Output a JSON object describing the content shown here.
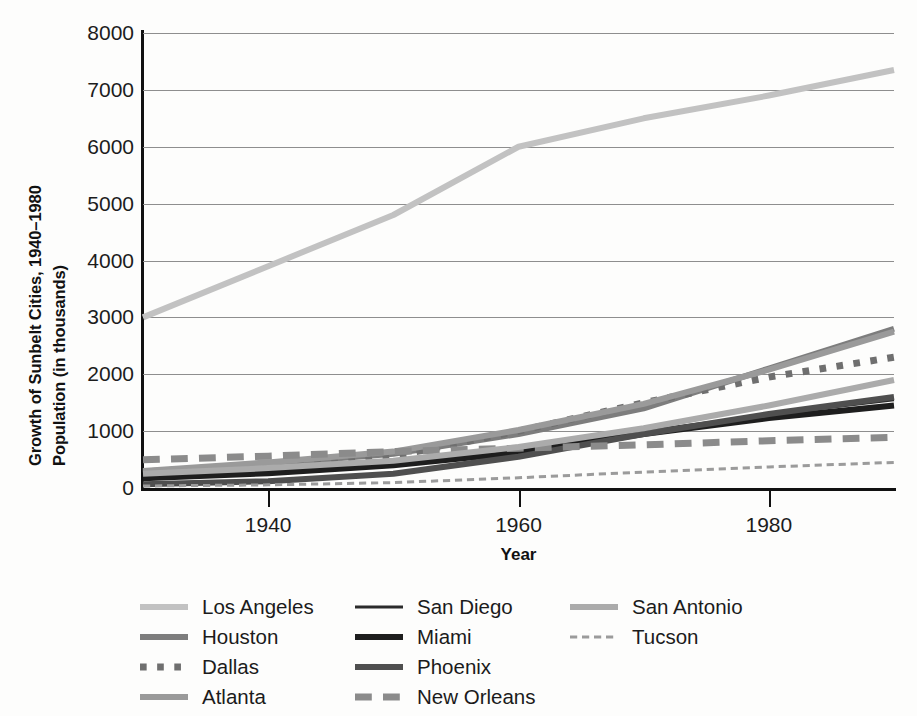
{
  "chart_data": {
    "type": "line",
    "title": "",
    "ylabel_line1": "Growth of Sunbelt Cities, 1940–1980",
    "ylabel_line2": "Population (in thousands)",
    "xlabel": "Year",
    "xlim": [
      1930,
      1990
    ],
    "ylim": [
      0,
      8000
    ],
    "yticks": [
      0,
      1000,
      2000,
      3000,
      4000,
      5000,
      6000,
      7000,
      8000
    ],
    "ytick_labels": [
      "0",
      "1000",
      "2000",
      "3000",
      "4000",
      "5000",
      "6000",
      "7000",
      "8000"
    ],
    "xticks": [
      1940,
      1960,
      1980
    ],
    "xtick_labels": [
      "1940",
      "1960",
      "1980"
    ],
    "grid": "horizontal",
    "legend_position": "below-plot-three-columns",
    "x": [
      1930,
      1940,
      1950,
      1960,
      1970,
      1980,
      1990
    ],
    "series": [
      {
        "name": "Los Angeles",
        "values": [
          3000,
          3900,
          4800,
          6000,
          6500,
          6900,
          7350
        ],
        "color": "#c2c2c2",
        "width": 6,
        "style": "solid"
      },
      {
        "name": "Houston",
        "values": [
          290,
          420,
          600,
          950,
          1400,
          2100,
          2800
        ],
        "color": "#7d7d7d",
        "width": 6,
        "style": "solid"
      },
      {
        "name": "Dallas",
        "values": [
          260,
          400,
          560,
          1000,
          1500,
          1950,
          2300
        ],
        "color": "#6f6f6f",
        "width": 7,
        "style": "dotted"
      },
      {
        "name": "Atlanta",
        "values": [
          300,
          450,
          640,
          1020,
          1480,
          2080,
          2750
        ],
        "color": "#9a9a9a",
        "width": 6,
        "style": "solid"
      },
      {
        "name": "San Diego",
        "values": [
          200,
          280,
          420,
          670,
          1000,
          1290,
          1550
        ],
        "color": "#2b2b2b",
        "width": 3,
        "style": "solid"
      },
      {
        "name": "Miami",
        "values": [
          170,
          260,
          400,
          620,
          950,
          1230,
          1450
        ],
        "color": "#1e1e1e",
        "width": 6,
        "style": "solid"
      },
      {
        "name": "Phoenix",
        "values": [
          65,
          120,
          250,
          550,
          950,
          1300,
          1600
        ],
        "color": "#4f4f4f",
        "width": 6,
        "style": "solid"
      },
      {
        "name": "New Orleans",
        "values": [
          495,
          560,
          640,
          700,
          760,
          830,
          890
        ],
        "color": "#8b8b8b",
        "width": 7,
        "style": "dashed"
      },
      {
        "name": "San Antonio",
        "values": [
          250,
          350,
          480,
          720,
          1050,
          1450,
          1900
        ],
        "color": "#ababab",
        "width": 6,
        "style": "solid"
      },
      {
        "name": "Tucson",
        "values": [
          35,
          55,
          95,
          180,
          280,
          370,
          450
        ],
        "color": "#9b9b9b",
        "width": 3,
        "style": "dashed"
      }
    ]
  },
  "legend": {
    "columns": [
      {
        "items": [
          {
            "label": "Los Angeles",
            "series": 0
          },
          {
            "label": "Houston",
            "series": 1
          },
          {
            "label": "Dallas",
            "series": 2
          },
          {
            "label": "Atlanta",
            "series": 3
          }
        ]
      },
      {
        "items": [
          {
            "label": "San Diego",
            "series": 4
          },
          {
            "label": "Miami",
            "series": 5
          },
          {
            "label": "Phoenix",
            "series": 6
          },
          {
            "label": "New Orleans",
            "series": 7
          }
        ]
      },
      {
        "items": [
          {
            "label": "San Antonio",
            "series": 8
          },
          {
            "label": "Tucson",
            "series": 9
          }
        ]
      }
    ]
  },
  "colors": {
    "background": "#fdfdfc",
    "axis": "#111111",
    "grid": "#8e8e8e",
    "text": "#1c1c1c"
  }
}
